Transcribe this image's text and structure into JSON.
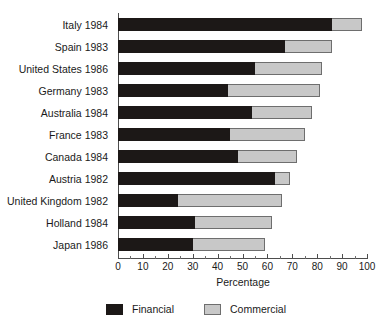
{
  "chart_data": {
    "type": "bar",
    "orientation": "horizontal",
    "stacked": true,
    "title": "",
    "xlabel": "Percentage",
    "ylabel": "",
    "xlim": [
      0,
      100
    ],
    "xticks": [
      0,
      10,
      20,
      30,
      40,
      50,
      60,
      70,
      80,
      90,
      100
    ],
    "xtick_labels": [
      "0",
      "10",
      "20",
      "30",
      "40",
      "50",
      "60",
      "70",
      "80",
      "90",
      "100"
    ],
    "minor_ticks_per_interval": 1,
    "grid": false,
    "legend_position": "bottom-center",
    "categories": [
      "Italy 1984",
      "Spain 1983",
      "United States 1986",
      "Germany 1983",
      "Australia 1984",
      "France 1983",
      "Canada 1984",
      "Austria 1982",
      "United Kingdom 1982",
      "Holland 1984",
      "Japan 1986"
    ],
    "series": [
      {
        "name": "Financial",
        "color": "#1c1817",
        "values": [
          86,
          67,
          55,
          44,
          54,
          45,
          48,
          63,
          24,
          31,
          30
        ]
      },
      {
        "name": "Commercial",
        "color": "#c8c8c8",
        "values": [
          12,
          19,
          27,
          37,
          24,
          30,
          24,
          6,
          42,
          31,
          29
        ]
      }
    ],
    "totals": [
      98,
      86,
      82,
      81,
      78,
      75,
      72,
      69,
      66,
      62,
      59
    ]
  },
  "legend": {
    "items": [
      {
        "label": "Financial",
        "swatch": "financial-swatch"
      },
      {
        "label": "Commercial",
        "swatch": "commercial-swatch"
      }
    ]
  },
  "axis": {
    "x_title": "Percentage"
  }
}
